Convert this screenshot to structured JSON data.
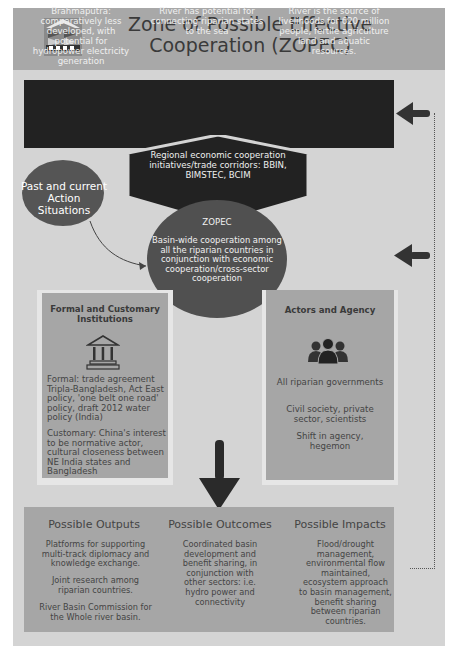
{
  "header": {
    "title": "Zone of Possible Effective Cooperation (ZOPEC)",
    "logo": "institution-logo-icon"
  },
  "context_bar": {
    "items": [
      "Brahmaputra: comparatively less developed, with potential for hydropower electricity generation",
      "River has potential for connecting riparian states to the sea",
      "River is the source of livelihoods for 620 million people, fertile agriculture land and aquatic resources."
    ]
  },
  "regional": {
    "text": "Regional economic cooperation initiatives/trade corridors: BBIN, BIMSTEC, BCIM"
  },
  "past": {
    "text": "Past and current Action Situations"
  },
  "zopec": {
    "title": "ZOPEC",
    "text": "Basin-wide cooperation among all the riparian countries in conjunction with economic cooperation/cross-sector cooperation"
  },
  "institutions": {
    "title": "Formal and Customary Institutions",
    "icon": "institution-building-icon",
    "formal": "Formal: trade agreement Tripla-Bangladesh, Act East policy, 'one belt one road' policy, draft 2012 water policy (India)",
    "customary": "Customary: China's interest to be normative actor, cultural closeness between NE India states and Bangladesh"
  },
  "actors": {
    "title": "Actors and Agency",
    "icon": "people-group-icon",
    "items": [
      "All riparian governments",
      "Civil society, private sector, scientists",
      "Shift in agency, hegemon"
    ]
  },
  "results": {
    "outputs": {
      "title": "Possible Outputs",
      "items": [
        "Platforms for supporting multi-track diplomacy and knowledge exchange.",
        "Joint research among riparian countries.",
        "River Basin Commission for the Whole river basin."
      ]
    },
    "outcomes": {
      "title": "Possible Outcomes",
      "text": "Coordinated basin development and benefit sharing, in conjunction with other sectors: i.e. hydro power and connectivity"
    },
    "impacts": {
      "title": "Possible Impacts",
      "text": "Flood/drought management, environmental flow maintained, ecosystem approach to basin management, benefit sharing between riparian countries."
    }
  },
  "colors": {
    "background": "#d4d4d4",
    "header": "#a8a8a8",
    "dark": "#222222",
    "ellipse": "#505050",
    "panel": "#a6a6a6"
  }
}
